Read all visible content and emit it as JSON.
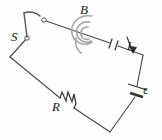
{
  "figure": {
    "kind": "circuit-diagram",
    "background_color": "#fefefe",
    "wire_color": "#4a4a4a",
    "field_color": "#a5a5a5",
    "label_color": "#1a1a1a"
  },
  "labels": {
    "magnetic_field": "B",
    "switch": "S",
    "current": "I",
    "resistor": "R",
    "emf": "ε"
  },
  "components": [
    {
      "id": "switch",
      "name": "switch",
      "label": "S",
      "state": "open",
      "icon": "switch-open-icon"
    },
    {
      "id": "magnetic-field",
      "name": "magnetic-field-coil",
      "label": "B",
      "icon": "field-spiral-icon"
    },
    {
      "id": "current",
      "name": "current-arrow",
      "label": "I",
      "icon": "arrow-icon"
    },
    {
      "id": "battery",
      "name": "battery",
      "label": "ε",
      "icon": "battery-icon"
    },
    {
      "id": "resistor",
      "name": "resistor",
      "label": "R",
      "icon": "resistor-zigzag-icon"
    }
  ]
}
